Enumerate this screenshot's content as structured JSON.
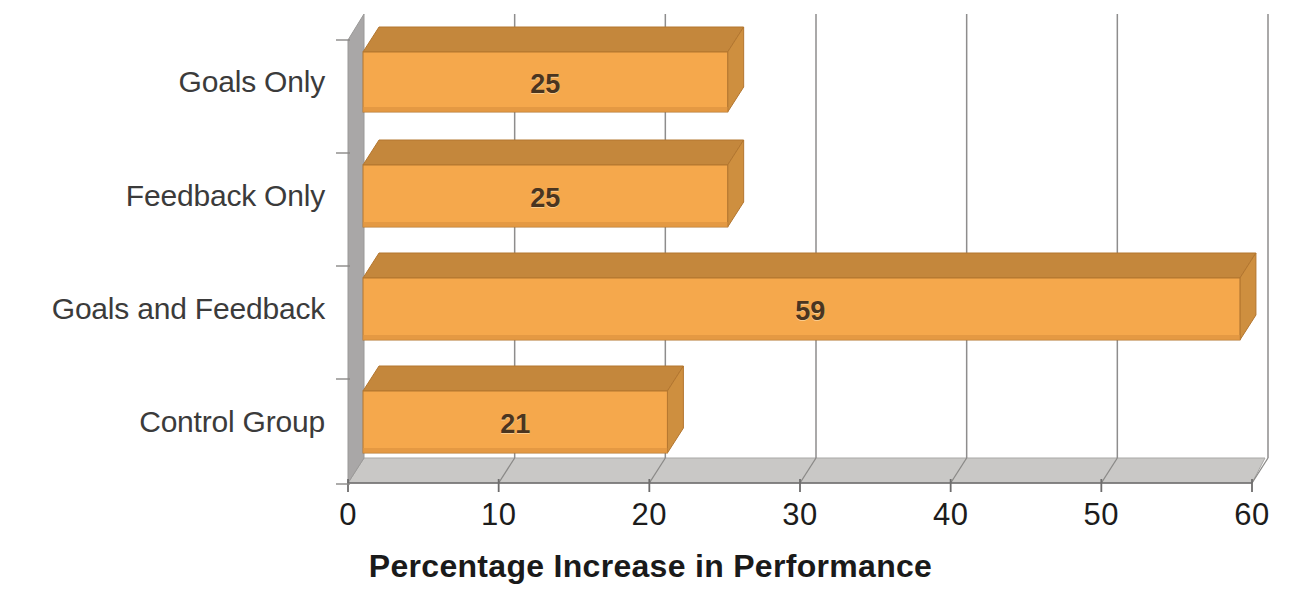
{
  "chart_data": {
    "type": "bar",
    "orientation": "horizontal",
    "style": "3d",
    "title": "",
    "xlabel": "Percentage Increase in Performance",
    "ylabel": "",
    "categories": [
      "Goals Only",
      "Feedback Only",
      "Goals and Feedback",
      "Control Group"
    ],
    "values": [
      25,
      25,
      59,
      21
    ],
    "value_labels": [
      "25",
      "25",
      "59",
      "21"
    ],
    "xlim": [
      0,
      60
    ],
    "xticks": [
      0,
      10,
      20,
      30,
      40,
      50,
      60
    ],
    "xtick_labels": [
      "0",
      "10",
      "20",
      "30",
      "40",
      "50",
      "60"
    ],
    "grid": true,
    "grid_axis": "x",
    "legend": null,
    "series": [
      {
        "name": "Percentage Increase in Performance",
        "values": [
          25,
          25,
          59,
          21
        ]
      }
    ]
  },
  "axis_title": "Percentage Increase in Performance",
  "categories": [
    {
      "label": "Goals Only",
      "value": 25,
      "value_label": "25"
    },
    {
      "label": "Feedback Only",
      "value": 25,
      "value_label": "25"
    },
    {
      "label": "Goals and Feedback",
      "value": 59,
      "value_label": "59"
    },
    {
      "label": "Control Group",
      "value": 21,
      "value_label": "21"
    }
  ],
  "ticks": [
    {
      "value": 0,
      "label": "0"
    },
    {
      "value": 10,
      "label": "10"
    },
    {
      "value": 20,
      "label": "20"
    },
    {
      "value": 30,
      "label": "30"
    },
    {
      "value": 40,
      "label": "40"
    },
    {
      "value": 50,
      "label": "50"
    },
    {
      "value": 60,
      "label": "60"
    }
  ],
  "colors": {
    "bar_front": "#F5A84C",
    "bar_top": "#C4873C",
    "bar_side": "#CE8F3F",
    "bar_outline": "#B3762F",
    "wall_left": "#A9A7A7",
    "floor": "#C9C8C6",
    "floor_back": "#BFBEBC",
    "gridline": "#8e8d8d",
    "axis_line": "#6e6d6d",
    "text_dark": "#1c1c1c",
    "text_category": "#3b3b3b",
    "value_text": "#4a3520",
    "background": "#ffffff"
  }
}
